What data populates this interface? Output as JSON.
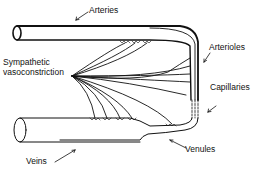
{
  "diagram": {
    "labels": {
      "arteries": "Arteries",
      "arterioles": "Arterioles",
      "sympathetic_line1": "Sympathetic",
      "sympathetic_line2": "vasoconstriction",
      "capillaries": "Capillaries",
      "veins": "Veins",
      "venules": "Venules"
    },
    "colors": {
      "stroke": "#111111",
      "background": "#ffffff"
    }
  }
}
